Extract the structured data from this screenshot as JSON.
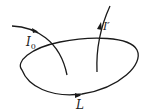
{
  "diagram": {
    "labels": {
      "loop": "L",
      "current_in": "I",
      "current_in_sub": "0",
      "current_out": "I′"
    },
    "colors": {
      "stroke": "#1a1a1a",
      "background": "#ffffff"
    }
  }
}
